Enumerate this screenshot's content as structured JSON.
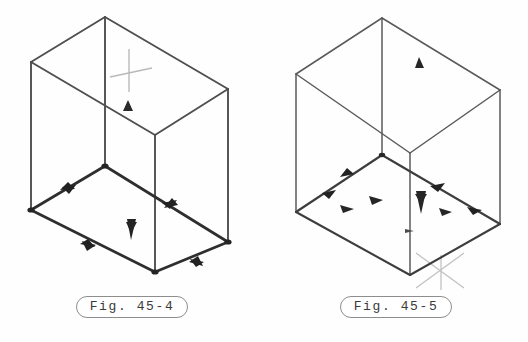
{
  "page": {
    "background_color": "#fefefe",
    "width": 528,
    "height": 342
  },
  "figures": [
    {
      "id": "fig-45-4",
      "caption": "Fig. 45-4",
      "shape": "rectangular-box-isometric-wireframe",
      "line_color": "#4a4a4a",
      "floor_line_color": "#2f2f2f",
      "marker_color": "#262626",
      "crosshair_color": "#b9b9b9",
      "description": "Open-top isometric rectangular box wireframe with directional arrowheads on the base edges, a light crosshair marker on the far vertical edge and a downward arrow on the floor."
    },
    {
      "id": "fig-45-5",
      "caption": "Fig. 45-5",
      "shape": "cube-isometric-wireframe",
      "line_color": "#5a5a5a",
      "floor_line_color": "#3d3d3d",
      "marker_color": "#262626",
      "crosshair_color": "#c2c2c2",
      "description": "Isometric cube wireframe with directional arrowheads on base edges, scattered arrow markers on the floor, and a light crosshair at the near bottom vertex."
    }
  ]
}
